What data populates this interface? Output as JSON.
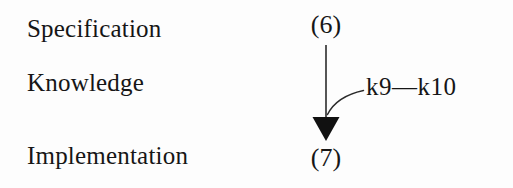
{
  "figure": {
    "background_color": "#fdfdfd",
    "ink_color": "#161616",
    "stages": [
      {
        "id": "specification",
        "label": "Specification"
      },
      {
        "id": "knowledge",
        "label": "Knowledge"
      },
      {
        "id": "implementation",
        "label": "Implementation"
      }
    ],
    "references": {
      "top": "(6)",
      "bottom": "(7)"
    },
    "arrow": {
      "direction": "down",
      "from_reference": "(6)",
      "to_reference": "(7)",
      "head_style": "solid-triangle",
      "head_color": "#111111",
      "shaft_color": "#2b2b2b"
    },
    "annotation": {
      "text": "k9—k10",
      "leader": "curved",
      "attaches_to": "arrow-shaft"
    }
  }
}
